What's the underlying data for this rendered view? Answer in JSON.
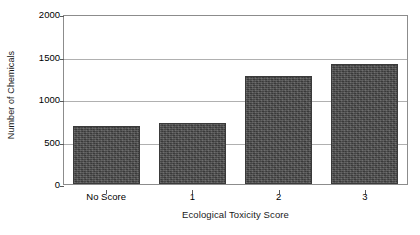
{
  "chart_data": {
    "type": "bar",
    "title": "",
    "subtitle": "",
    "xlabel": "Ecological Toxicity Score",
    "ylabel": "Number of Chemicals",
    "categories": [
      "No Score",
      "1",
      "2",
      "3"
    ],
    "values": [
      680,
      715,
      1275,
      1410
    ],
    "series": [
      {
        "name": "Number of Chemicals",
        "values": [
          680,
          715,
          1275,
          1410
        ]
      }
    ],
    "ylim": [
      0,
      2000
    ],
    "yticks": [
      0,
      500,
      1000,
      1500,
      2000
    ],
    "ytick_labels": [
      "0",
      "500",
      "1000",
      "1500",
      "2000"
    ],
    "grid": "horizontal",
    "legend": "none",
    "bar_color": "#4a4a4a",
    "gridline_color": "#b0b0b0",
    "axis_color": "#8c8c8c",
    "background": "#ffffff"
  }
}
